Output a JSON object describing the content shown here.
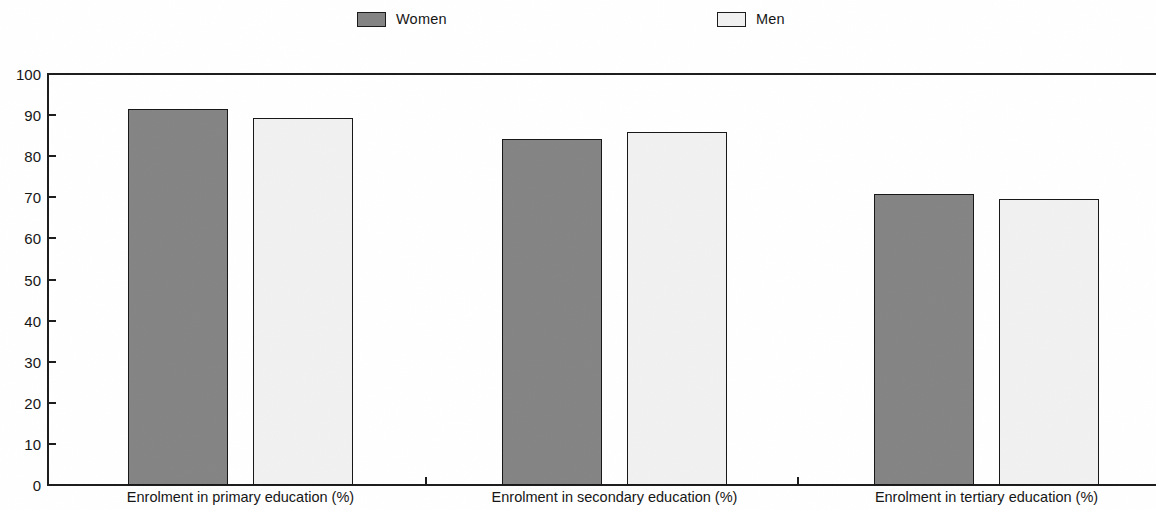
{
  "chart_data": {
    "type": "bar",
    "title": "",
    "subtitle": "",
    "xlabel": "",
    "ylabel": "",
    "ylim": [
      0,
      100
    ],
    "yticks": [
      0,
      10,
      20,
      30,
      40,
      50,
      60,
      70,
      80,
      90,
      100
    ],
    "ytick_labels": [
      "0",
      "10",
      "20",
      "30",
      "40",
      "50",
      "60",
      "70",
      "80",
      "90",
      "100"
    ],
    "grid": false,
    "legend_position": "top",
    "categories": [
      "Enrolment in primary education (%)",
      "Enrolment in secondary education (%)",
      "Enrolment in tertiary education (%)"
    ],
    "series": [
      {
        "name": "Women",
        "color": "#848484",
        "values": [
          91.5,
          84.3,
          70.7
        ]
      },
      {
        "name": "Men",
        "color": "#f1f1f1",
        "values": [
          89.4,
          86.0,
          69.6
        ]
      }
    ]
  },
  "legend": {
    "items": [
      {
        "label": "Women",
        "swatch_color": "#848484"
      },
      {
        "label": "Men",
        "swatch_color": "#f1f1f1"
      }
    ]
  },
  "axes": {
    "y": {
      "min": 0,
      "max": 100,
      "step": 10,
      "labels": [
        "100",
        "90",
        "80",
        "70",
        "60",
        "50",
        "40",
        "30",
        "20",
        "10",
        "0"
      ]
    },
    "x": {
      "labels": [
        "Enrolment in primary education (%)",
        "Enrolment in secondary education (%)",
        "Enrolment in tertiary education (%)"
      ]
    }
  },
  "colors": {
    "women_bar": "#848484",
    "men_bar": "#f1f1f1",
    "axis": "#1c1c1c",
    "text": "#141414",
    "background": "#ffffff"
  }
}
